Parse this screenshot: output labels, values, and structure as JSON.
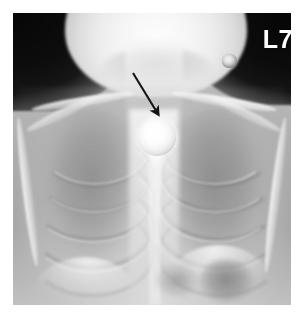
{
  "image": {
    "modality": "chest-radiograph",
    "view": "frontal",
    "width": 304,
    "height": 323,
    "border_color": "#ffffff",
    "film_background_color": "#0a0a0a"
  },
  "labels": {
    "side_marker": "L7"
  },
  "annotations": {
    "arrow": {
      "name": "pointer-arrow",
      "color": "#151515",
      "tail_x": 120,
      "tail_y": 60,
      "tip_x": 148,
      "tip_y": 105
    }
  },
  "findings": {
    "foreign_body": {
      "name": "radiopaque-round-foreign-body",
      "shape": "circular",
      "location": "upper-mediastinum",
      "diameter_px": 38,
      "center_x": 144,
      "center_y": 124,
      "color": "#ffffff"
    },
    "external_marker": {
      "name": "small-radiopaque-object",
      "center_x": 216,
      "center_y": 48,
      "diameter_px": 15,
      "color": "#e2e2e2"
    }
  },
  "anatomy": {
    "head": "skull-and-mandible",
    "neck": "soft-tissue-column",
    "lung_left": "left-lung-field",
    "lung_right": "right-lung-field",
    "mediastinum": "central-mediastinum",
    "spine": "thoracic-spine",
    "clavicle_left": "left-clavicle",
    "clavicle_right": "right-clavicle",
    "diaphragm_left": "left-hemidiaphragm",
    "diaphragm_right": "right-hemidiaphragm",
    "gastric_bubble": "gastric-air-bubble",
    "ribs_count": 8
  }
}
